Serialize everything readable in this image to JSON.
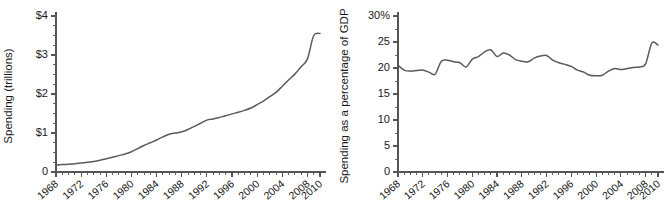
{
  "figure": {
    "background_color": "#ffffff",
    "line_color": "#5a5a5a",
    "axis_color": "#555555",
    "text_color": "#1a1a1a"
  },
  "chart_data": [
    {
      "type": "line",
      "panel": "left",
      "title": "",
      "xlabel": "",
      "ylabel": "Spending (trillions)",
      "xlim": [
        1968,
        2010
      ],
      "ylim": [
        0,
        4
      ],
      "grid": false,
      "legend": "none",
      "ytick_labels": [
        "$4",
        "$3",
        "$2",
        "$1",
        "0"
      ],
      "ytick_values": [
        4,
        3,
        2,
        1,
        0
      ],
      "yminor_step": 0.25,
      "xtick_labels": [
        "1968",
        "1972",
        "1976",
        "1980",
        "1984",
        "1988",
        "1992",
        "1996",
        "2000",
        "2004",
        "2008",
        "2010"
      ],
      "xtick_values": [
        1968,
        1972,
        1976,
        1980,
        1984,
        1988,
        1992,
        1996,
        2000,
        2004,
        2008,
        2010
      ],
      "xminor_step": 1,
      "x": [
        1968,
        1969,
        1970,
        1971,
        1972,
        1973,
        1974,
        1975,
        1976,
        1977,
        1978,
        1979,
        1980,
        1981,
        1982,
        1983,
        1984,
        1985,
        1986,
        1987,
        1988,
        1989,
        1990,
        1991,
        1992,
        1993,
        1994,
        1995,
        1996,
        1997,
        1998,
        1999,
        2000,
        2001,
        2002,
        2003,
        2004,
        2005,
        2006,
        2007,
        2008,
        2009,
        2010
      ],
      "values": [
        0.18,
        0.19,
        0.2,
        0.21,
        0.23,
        0.25,
        0.27,
        0.3,
        0.34,
        0.38,
        0.42,
        0.46,
        0.52,
        0.6,
        0.68,
        0.75,
        0.82,
        0.9,
        0.97,
        1.0,
        1.03,
        1.09,
        1.17,
        1.25,
        1.33,
        1.36,
        1.4,
        1.44,
        1.49,
        1.53,
        1.58,
        1.64,
        1.73,
        1.82,
        1.93,
        2.04,
        2.2,
        2.36,
        2.51,
        2.7,
        2.9,
        3.5,
        3.55
      ]
    },
    {
      "type": "line",
      "panel": "right",
      "title": "",
      "xlabel": "",
      "ylabel": "Spending as a percentage of GDP",
      "xlim": [
        1968,
        2010
      ],
      "ylim": [
        0,
        30
      ],
      "grid": false,
      "legend": "none",
      "ytick_labels": [
        "30%",
        "25",
        "20",
        "15",
        "10",
        "5",
        "0"
      ],
      "ytick_values": [
        30,
        25,
        20,
        15,
        10,
        5,
        0
      ],
      "yminor_step": 2.5,
      "xtick_labels": [
        "1968",
        "1972",
        "1976",
        "1980",
        "1984",
        "1988",
        "1992",
        "1996",
        "2000",
        "2004",
        "2008",
        "2010"
      ],
      "xtick_values": [
        1968,
        1972,
        1976,
        1980,
        1984,
        1988,
        1992,
        1996,
        2000,
        2004,
        2008,
        2010
      ],
      "xminor_step": 1,
      "x": [
        1968,
        1969,
        1970,
        1971,
        1972,
        1973,
        1974,
        1975,
        1976,
        1977,
        1978,
        1979,
        1980,
        1981,
        1982,
        1983,
        1984,
        1985,
        1986,
        1987,
        1988,
        1989,
        1990,
        1991,
        1992,
        1993,
        1994,
        1995,
        1996,
        1997,
        1998,
        1999,
        2000,
        2001,
        2002,
        2003,
        2004,
        2005,
        2006,
        2007,
        2008,
        2009,
        2010
      ],
      "values": [
        20.5,
        19.6,
        19.4,
        19.5,
        19.6,
        19.2,
        18.8,
        21.3,
        21.5,
        21.2,
        21.0,
        20.2,
        21.7,
        22.2,
        23.1,
        23.5,
        22.2,
        22.9,
        22.5,
        21.6,
        21.3,
        21.2,
        21.9,
        22.3,
        22.4,
        21.5,
        21.0,
        20.7,
        20.3,
        19.6,
        19.2,
        18.6,
        18.5,
        18.6,
        19.4,
        19.9,
        19.7,
        19.9,
        20.1,
        20.2,
        20.8,
        24.8,
        24.4
      ]
    }
  ]
}
